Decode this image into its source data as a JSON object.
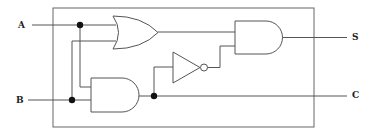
{
  "diagram": {
    "type": "logic-circuit",
    "inputs": [
      {
        "label": "A"
      },
      {
        "label": "B"
      }
    ],
    "outputs": [
      {
        "label": "S"
      },
      {
        "label": "C"
      }
    ],
    "gates": [
      {
        "id": "or1",
        "type": "OR",
        "inputs": [
          "A",
          "B"
        ]
      },
      {
        "id": "and1",
        "type": "AND",
        "inputs": [
          "A",
          "B"
        ],
        "output": "C"
      },
      {
        "id": "not1",
        "type": "NOT",
        "inputs": [
          "and1"
        ]
      },
      {
        "id": "and2",
        "type": "AND",
        "inputs": [
          "or1",
          "not1"
        ],
        "output": "S"
      }
    ],
    "colors": {
      "wire": "#555555",
      "junction": "#111111",
      "background": "#ffffff"
    }
  }
}
